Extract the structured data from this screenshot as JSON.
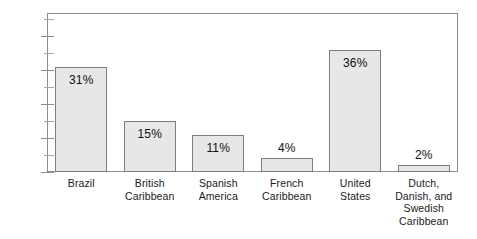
{
  "chart_data": {
    "type": "bar",
    "title": "",
    "subtitle": "",
    "xlabel": "",
    "ylabel": "",
    "ylim": [
      0,
      47
    ],
    "grid": false,
    "legend": null,
    "y_ticks_major": [
      "0%",
      "10%",
      "20%",
      "30%",
      "40%"
    ],
    "y_tick_major_values": [
      0,
      10,
      20,
      30,
      40
    ],
    "y_tick_minor_values": [
      5,
      15,
      25,
      35,
      45
    ],
    "categories": [
      "Brazil",
      "British Caribbean",
      "Spanish America",
      "French Caribbean",
      "United States",
      "Dutch, Danish, and Swedish Caribbean"
    ],
    "category_label_lines": [
      [
        "Brazil"
      ],
      [
        "British",
        "Caribbean"
      ],
      [
        "Spanish",
        "America"
      ],
      [
        "French",
        "Caribbean"
      ],
      [
        "United",
        "States"
      ],
      [
        "Dutch,",
        "Danish, and",
        "Swedish",
        "Caribbean"
      ]
    ],
    "values": [
      31,
      15,
      11,
      4,
      36,
      2
    ],
    "value_labels": [
      "31%",
      "15%",
      "11%",
      "4%",
      "36%",
      "2%"
    ],
    "value_label_position": [
      "inside",
      "inside",
      "inside",
      "above",
      "inside",
      "above"
    ],
    "colors": {
      "bar_fill": "#e7e7e7",
      "bar_border": "#7d7d7d",
      "axis": "#8d8d8d",
      "text": "#1a1a1a",
      "background": "#ffffff"
    }
  }
}
